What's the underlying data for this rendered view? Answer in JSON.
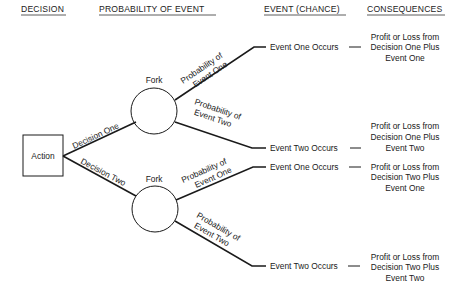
{
  "headers": {
    "decision": "DECISION",
    "probability": "PROBABILITY OF EVENT",
    "event": "EVENT (CHANCE)",
    "consequences": "CONSEQUENCES"
  },
  "action": {
    "label": "Action"
  },
  "decisions": [
    {
      "label": "Decision One",
      "fork_label": "Fork",
      "branches": [
        {
          "prob_line1": "Probability of",
          "prob_line2": "Event One",
          "event": "Event One Occurs",
          "consequence": [
            "Profit or Loss from",
            "Decision One Plus",
            "Event One"
          ]
        },
        {
          "prob_line1": "Probability of",
          "prob_line2": "Event Two",
          "event": "Event Two Occurs",
          "consequence": [
            "Profit or Loss from",
            "Decision One Plus",
            "Event Two"
          ]
        }
      ]
    },
    {
      "label": "Decision Two",
      "fork_label": "Fork",
      "branches": [
        {
          "prob_line1": "Probability of",
          "prob_line2": "Event One",
          "event": "Event One Occurs",
          "consequence": [
            "Profit or Loss from",
            "Decision Two Plus",
            "Event One"
          ]
        },
        {
          "prob_line1": "Probability of",
          "prob_line2": "Event Two",
          "event": "Event Two Occurs",
          "consequence": [
            "Profit or Loss from",
            "Decision Two Plus",
            "Event Two"
          ]
        }
      ]
    }
  ],
  "dash": "—"
}
